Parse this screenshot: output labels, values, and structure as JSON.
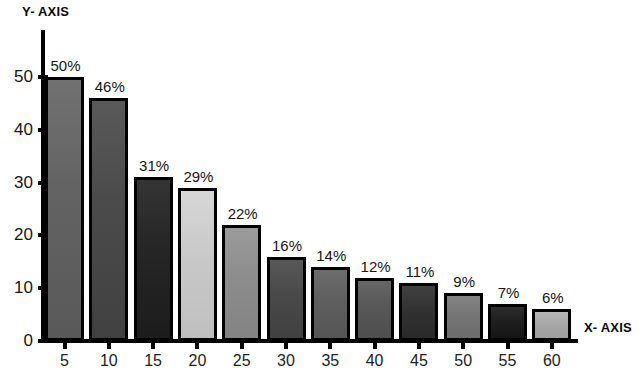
{
  "chart_data": {
    "type": "bar",
    "title": "",
    "xlabel": "X- AXIS",
    "ylabel": "Y- AXIS",
    "categories": [
      "5",
      "10",
      "15",
      "20",
      "25",
      "30",
      "35",
      "40",
      "45",
      "50",
      "55",
      "60"
    ],
    "values": [
      50,
      46,
      31,
      29,
      22,
      16,
      14,
      12,
      11,
      9,
      7,
      6
    ],
    "data_labels": [
      "50%",
      "46%",
      "31%",
      "29%",
      "22%",
      "16%",
      "14%",
      "12%",
      "11%",
      "9%",
      "7%",
      "6%"
    ],
    "ylim": [
      0,
      50
    ],
    "yticks": [
      0,
      10,
      20,
      30,
      40,
      50
    ],
    "ytick_labels": [
      "0",
      "10",
      "20",
      "30",
      "40",
      "50"
    ],
    "grid": false,
    "legend": false,
    "bar_colors": [
      "#636363",
      "#4b4b4b",
      "#262626",
      "#c9c9c9",
      "#8d8d8d",
      "#4a4a4a",
      "#5f5f5f",
      "#585858",
      "#333333",
      "#767676",
      "#1f1f1f",
      "#a8a8a8"
    ],
    "bar_outline_color": "#000000",
    "background_color": "#ffffff"
  },
  "axes": {
    "x_title": "X- AXIS",
    "y_title": "Y- AXIS"
  }
}
